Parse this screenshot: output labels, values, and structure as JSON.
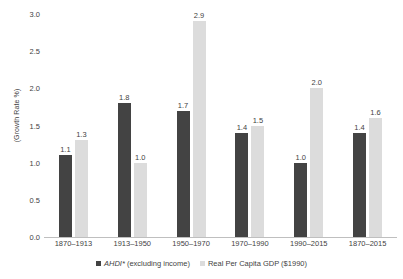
{
  "chart_data": {
    "type": "bar",
    "title": "",
    "subtitle": "",
    "xlabel": "",
    "ylabel": "(Growth Rate %)",
    "ylim": [
      0,
      3.0
    ],
    "ytick_step": 0.5,
    "yticks": [
      "3.0",
      "2.5",
      "2.0",
      "1.5",
      "1.0",
      "0.5",
      "0.0"
    ],
    "ytick_values": [
      3.0,
      2.5,
      2.0,
      1.5,
      1.0,
      0.5,
      0.0
    ],
    "grid": false,
    "legend_position": "bottom-center",
    "categories": [
      "1870–1913",
      "1913–1950",
      "1950–1970",
      "1970–1990",
      "1990–2015",
      "1870–2015"
    ],
    "series": [
      {
        "name": "AHDI* (excluding income)",
        "name_italic_prefix": "AHDI*",
        "name_rest": " (excluding income)",
        "color": "#434343",
        "values": [
          1.1,
          1.8,
          1.7,
          1.4,
          1.0,
          1.4
        ],
        "labels": [
          "1.1",
          "1.8",
          "1.7",
          "1.4",
          "1.0",
          "1.4"
        ]
      },
      {
        "name": "Real Per Capita GDP ($1990)",
        "color": "#dcdcdc",
        "values": [
          1.3,
          1.0,
          2.9,
          1.5,
          2.0,
          1.6
        ],
        "labels": [
          "1.3",
          "1.0",
          "2.9",
          "1.5",
          "2.0",
          "1.6"
        ]
      }
    ]
  },
  "colors": {
    "series_a": "#434343",
    "series_b": "#dcdcdc",
    "axis": "#bfbfbf",
    "text": "#3f3f3f",
    "background": "#ffffff"
  }
}
